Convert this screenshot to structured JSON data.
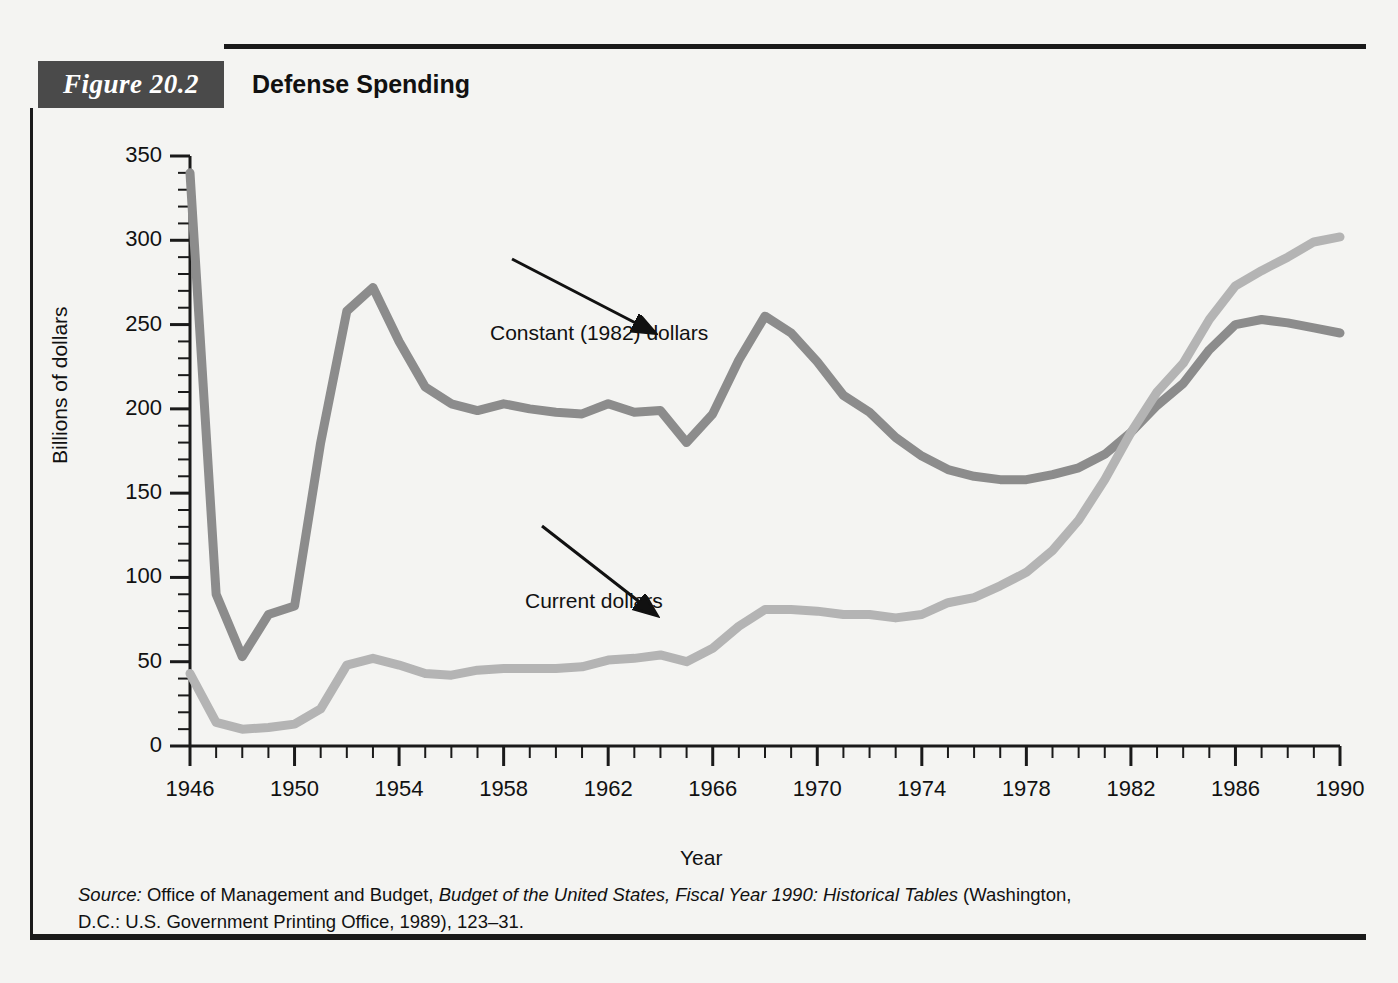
{
  "figure": {
    "tab_label": "Figure 20.2",
    "title": "Defense Spending"
  },
  "source": {
    "lead": "Source:",
    "text_1": " Office of Management and Budget, ",
    "italic_1": "Budget of the United States, Fiscal Year 1990: Historical Tables",
    "text_2": " (Washington, D.C.: U.S. Government Printing Office, 1989), 123–31."
  },
  "annotations": {
    "constant": "Constant (1982) dollars",
    "current": "Current dollars"
  },
  "axes": {
    "y_title": "Billions of dollars",
    "x_title": "Year",
    "y_ticks": [
      "0",
      "50",
      "100",
      "150",
      "200",
      "250",
      "300",
      "350"
    ],
    "x_ticks": [
      "1946",
      "1950",
      "1954",
      "1958",
      "1962",
      "1966",
      "1970",
      "1974",
      "1978",
      "1982",
      "1986",
      "1990"
    ]
  },
  "colors": {
    "constant_line": "#8c8c8c",
    "current_line": "#b4b4b4",
    "axis": "#1a1a1a",
    "tab_background": "#4a4a4a",
    "page_background": "#f4f4f2"
  },
  "chart_data": {
    "type": "line",
    "title": "Defense Spending",
    "xlabel": "Year",
    "ylabel": "Billions of dollars",
    "xlim": [
      1946,
      1990
    ],
    "ylim": [
      0,
      350
    ],
    "y_major_step": 50,
    "y_minor_step": 10,
    "x_major_step": 4,
    "x_minor_step": 1,
    "grid": false,
    "legend": "inline annotations with arrows",
    "x": [
      1946,
      1947,
      1948,
      1949,
      1950,
      1951,
      1952,
      1953,
      1954,
      1955,
      1956,
      1957,
      1958,
      1959,
      1960,
      1961,
      1962,
      1963,
      1964,
      1965,
      1966,
      1967,
      1968,
      1969,
      1970,
      1971,
      1972,
      1973,
      1974,
      1975,
      1976,
      1977,
      1978,
      1979,
      1980,
      1981,
      1982,
      1983,
      1984,
      1985,
      1986,
      1987,
      1988,
      1989,
      1990
    ],
    "series": [
      {
        "name": "Constant (1982) dollars",
        "color": "#8c8c8c",
        "values": [
          340,
          90,
          53,
          78,
          83,
          180,
          258,
          272,
          240,
          213,
          203,
          199,
          203,
          200,
          198,
          197,
          203,
          198,
          199,
          180,
          197,
          229,
          255,
          245,
          228,
          208,
          198,
          183,
          172,
          164,
          160,
          158,
          158,
          161,
          165,
          173,
          186,
          202,
          215,
          235,
          250,
          253,
          251,
          248,
          245
        ]
      },
      {
        "name": "Current dollars",
        "color": "#b4b4b4",
        "values": [
          43,
          14,
          10,
          11,
          13,
          22,
          48,
          52,
          48,
          43,
          42,
          45,
          46,
          46,
          46,
          47,
          51,
          52,
          54,
          50,
          58,
          71,
          81,
          81,
          80,
          78,
          78,
          76,
          78,
          85,
          88,
          95,
          103,
          116,
          134,
          158,
          186,
          210,
          227,
          253,
          273,
          282,
          290,
          299,
          302
        ]
      }
    ],
    "annotations": [
      {
        "text": "Constant (1982) dollars",
        "points_to_x": 1966,
        "points_to_y": 228
      },
      {
        "text": "Current dollars",
        "points_to_x": 1966,
        "points_to_y": 66
      }
    ]
  }
}
